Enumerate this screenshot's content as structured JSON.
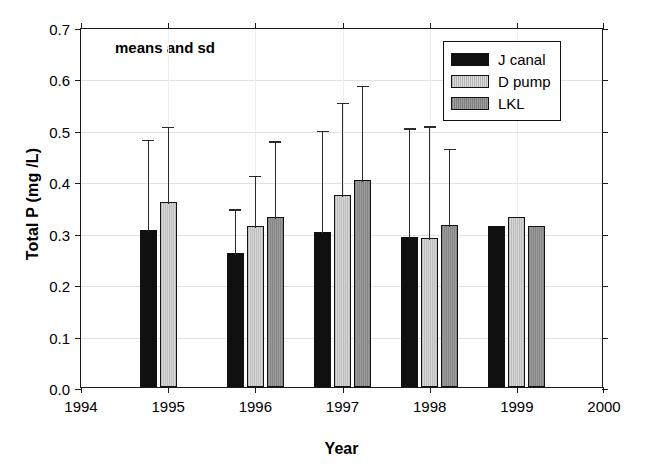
{
  "chart_data": {
    "type": "bar",
    "title": "",
    "annotation": "means and sd",
    "xlabel": "Year",
    "ylabel": "Total P (mg /L)",
    "ylim": [
      0.0,
      0.7
    ],
    "xlim": [
      1994,
      2000
    ],
    "ytick_labels": [
      "0.0",
      "0.1",
      "0.2",
      "0.3",
      "0.4",
      "0.5",
      "0.6",
      "0.7"
    ],
    "ytick_values": [
      0.0,
      0.1,
      0.2,
      0.3,
      0.4,
      0.5,
      0.6,
      0.7
    ],
    "xtick_labels": [
      "1994",
      "1995",
      "1996",
      "1997",
      "1998",
      "1999",
      "2000"
    ],
    "xtick_values": [
      1994,
      1995,
      1996,
      1997,
      1998,
      1999,
      2000
    ],
    "grid": true,
    "legend_position": "top-right",
    "categories": [
      "1995",
      "1996",
      "1997",
      "1998",
      "1999"
    ],
    "series": [
      {
        "name": "J canal",
        "color": "#101010",
        "values": [
          0.305,
          0.26,
          0.302,
          0.291,
          0.314
        ],
        "errors": [
          0.18,
          0.09,
          0.2,
          0.216,
          null
        ]
      },
      {
        "name": "D pump",
        "color": "#c9c9c9",
        "values": [
          0.359,
          0.313,
          0.373,
          0.289,
          0.331
        ],
        "errors": [
          0.151,
          0.102,
          0.184,
          0.222,
          null
        ]
      },
      {
        "name": "LKL",
        "color": "#8f8f8f",
        "values": [
          null,
          0.331,
          0.402,
          0.315,
          0.313
        ],
        "errors": [
          null,
          0.151,
          0.188,
          0.152,
          null
        ]
      }
    ]
  },
  "legend": {
    "items": [
      {
        "label": "J canal"
      },
      {
        "label": "D pump"
      },
      {
        "label": "LKL"
      }
    ]
  }
}
